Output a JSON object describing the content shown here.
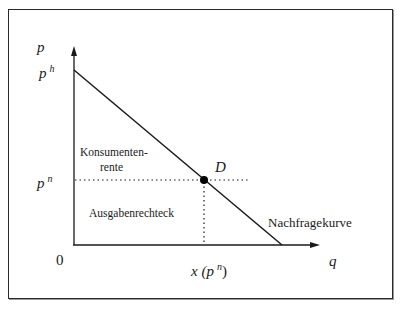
{
  "diagram": {
    "type": "economics-demand-curve",
    "axes": {
      "y_label": "p",
      "x_label": "q",
      "origin_label": "0"
    },
    "price_labels": {
      "high_price": {
        "base": "p",
        "sup": "h"
      },
      "market_price": {
        "base": "p",
        "sup": "n"
      }
    },
    "quantity_label": {
      "prefix": "x (",
      "base": "p",
      "sup": "n",
      "suffix": ")"
    },
    "point": {
      "label": "D"
    },
    "regions": {
      "consumer_surplus_line1": "Konsumenten-",
      "consumer_surplus_line2": "rente",
      "expenditure_rectangle": "Ausgabenrechteck"
    },
    "curve_label": "Nachfragekurve",
    "colors": {
      "line": "#1a1a1a",
      "frame": "#2a2a2a",
      "background": "#ffffff"
    }
  }
}
